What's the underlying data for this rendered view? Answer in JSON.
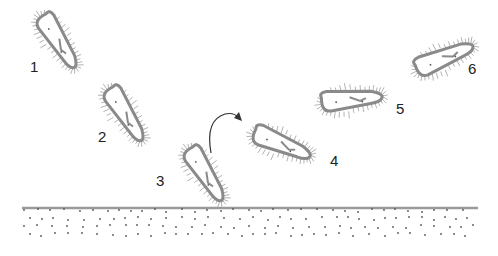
{
  "diagram": {
    "title": "",
    "colors": {
      "cell_outline": "#8a8a8a",
      "cilia": "#a0a0a0",
      "surface_line": "#9a9a9a",
      "sediment_dots": "#555555",
      "label_text": "#222222",
      "arrow": "#333333"
    },
    "cells": [
      {
        "label": "1",
        "cx": 58,
        "cy": 42,
        "angle": 55,
        "label_x": 30,
        "label_y": 68
      },
      {
        "label": "2",
        "cx": 125,
        "cy": 115,
        "angle": 55,
        "label_x": 98,
        "label_y": 138
      },
      {
        "label": "3",
        "cx": 205,
        "cy": 175,
        "angle": 55,
        "label_x": 156,
        "label_y": 182
      },
      {
        "label": "4",
        "cx": 282,
        "cy": 145,
        "angle": 20,
        "label_x": 330,
        "label_y": 162
      },
      {
        "label": "5",
        "cx": 352,
        "cy": 100,
        "angle": -8,
        "label_x": 396,
        "label_y": 110
      },
      {
        "label": "6",
        "cx": 445,
        "cy": 58,
        "angle": -25,
        "label_x": 468,
        "label_y": 70
      }
    ],
    "arrow": {
      "label": "turning-direction"
    },
    "surface": {
      "y": 208,
      "x_start": 22,
      "x_end": 478
    }
  }
}
